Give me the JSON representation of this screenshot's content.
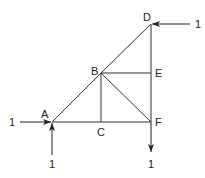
{
  "diagram": {
    "type": "truss",
    "nodes": {
      "A": {
        "label": "A",
        "x": 52,
        "y": 122
      },
      "B": {
        "label": "B",
        "x": 101,
        "y": 73
      },
      "C": {
        "label": "C",
        "x": 101,
        "y": 122
      },
      "D": {
        "label": "D",
        "x": 151,
        "y": 24
      },
      "E": {
        "label": "E",
        "x": 151,
        "y": 73
      },
      "F": {
        "label": "F",
        "x": 151,
        "y": 122
      }
    },
    "members": [
      [
        "A",
        "B"
      ],
      [
        "B",
        "D"
      ],
      [
        "A",
        "C"
      ],
      [
        "C",
        "F"
      ],
      [
        "D",
        "E"
      ],
      [
        "E",
        "F"
      ],
      [
        "B",
        "E"
      ],
      [
        "B",
        "C"
      ],
      [
        "B",
        "F"
      ]
    ],
    "loads": {
      "a_horizontal": {
        "value": "1",
        "at": "A",
        "direction": "right"
      },
      "a_vertical": {
        "value": "1",
        "at": "A",
        "direction": "up"
      },
      "d_horizontal": {
        "value": "1",
        "at": "D",
        "direction": "left"
      },
      "f_vertical": {
        "value": "1",
        "at": "F",
        "direction": "down"
      }
    },
    "line_color": "#333333"
  }
}
